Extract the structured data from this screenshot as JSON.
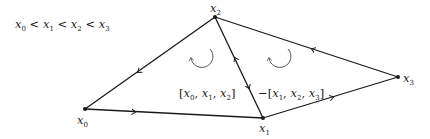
{
  "diagram": {
    "condition": "x0 < x1 < x2 < x3",
    "vertices": [
      {
        "id": "x0",
        "label": "x",
        "sub": "0"
      },
      {
        "id": "x1",
        "label": "x",
        "sub": "1"
      },
      {
        "id": "x2",
        "label": "x",
        "sub": "2"
      },
      {
        "id": "x3",
        "label": "x",
        "sub": "3"
      }
    ],
    "edges": [
      {
        "from": "x2",
        "to": "x0",
        "arrow": "toward x0"
      },
      {
        "from": "x0",
        "to": "x1",
        "arrow": "toward x1"
      },
      {
        "from": "x1",
        "to": "x2",
        "arrow": "both directions"
      },
      {
        "from": "x1",
        "to": "x3",
        "arrow": "toward x3"
      },
      {
        "from": "x3",
        "to": "x2",
        "arrow": "toward x2"
      }
    ],
    "faces": [
      {
        "label": "[x0, x1, x2]",
        "orientation": "counterclockwise"
      },
      {
        "label": "-[x1, x2, x3]",
        "orientation": "counterclockwise"
      }
    ]
  }
}
